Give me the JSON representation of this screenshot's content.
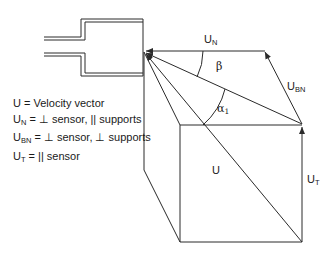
{
  "figure": {
    "type": "vector-decomposition-diagram"
  },
  "legend": [
    {
      "symbol": "U",
      "sub": "",
      "text": " = Velocity vector"
    },
    {
      "symbol": "U",
      "sub": "N",
      "text": " = ⊥ sensor, || supports"
    },
    {
      "symbol": "U",
      "sub": "BN",
      "text": " = ⊥ sensor, ⊥ supports"
    },
    {
      "symbol": "U",
      "sub": "T",
      "text": " = || sensor"
    }
  ],
  "labels": {
    "un": {
      "base": "U",
      "sub": "N"
    },
    "ubn": {
      "base": "U",
      "sub": "BN"
    },
    "u": {
      "base": "U",
      "sub": ""
    },
    "ut": {
      "base": "U",
      "sub": "T"
    },
    "beta": {
      "base": "β",
      "sub": ""
    },
    "alpha": {
      "base": "α",
      "sub": "1"
    }
  },
  "colors": {
    "stroke": "#2a2a2a",
    "text": "#1a1a1a",
    "background": "#ffffff"
  }
}
